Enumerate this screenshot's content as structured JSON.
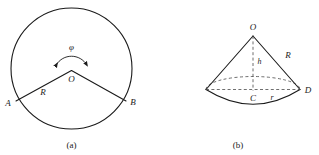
{
  "figure": {
    "title_note": "Two geometry diagrams: circular sector and cone",
    "panels": [
      {
        "caption": "(a)",
        "name": "circle-sector-panel",
        "shape": "circle",
        "labels": {
          "angle": "φ",
          "center": "O",
          "radius": "R",
          "point_left": "A",
          "point_right": "B"
        }
      },
      {
        "caption": "(b)",
        "name": "cone-panel",
        "shape": "cone",
        "labels": {
          "apex": "O",
          "height": "h",
          "slant": "R",
          "base_center": "C",
          "base_radius": "r",
          "base_point": "D"
        }
      }
    ],
    "colors": {
      "ink": "#1a1a1a",
      "dash": "#4a4a4a",
      "background": "#ffffff"
    }
  }
}
